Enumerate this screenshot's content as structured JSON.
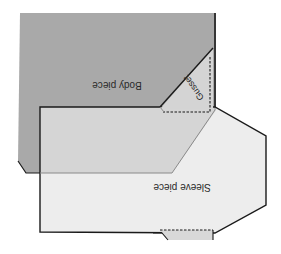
{
  "diagram": {
    "type": "sewing-pattern-layout",
    "orientation": "rotated-180",
    "pieces": {
      "body": {
        "label": "Body piece",
        "fill": "#a9a9a9"
      },
      "sleeve": {
        "label": "Sleeve piece",
        "fill": "#e4e4e4"
      },
      "gusset": {
        "label": "Gusset",
        "fill": "#d4d4d4"
      }
    },
    "colors": {
      "outline": "#1a1a1a",
      "overlap_edge": "#8a8a8a",
      "seam_dashed": "#1a1a1a",
      "background": "#ffffff"
    }
  }
}
